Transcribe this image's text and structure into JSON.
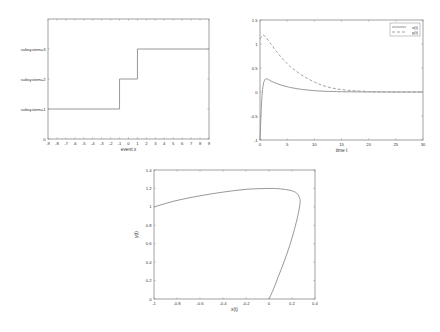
{
  "chart_data": [
    {
      "id": "switching-signal",
      "type": "line",
      "title": "",
      "xlabel": "event x",
      "ylabel": "",
      "xlim": [
        -9,
        9
      ],
      "ylim": [
        0,
        4
      ],
      "grid": false,
      "xticks": [
        -9,
        -8,
        -7,
        -6,
        -5,
        -4,
        -3,
        -2,
        -1,
        0,
        1,
        2,
        3,
        4,
        5,
        6,
        7,
        8,
        9
      ],
      "yticks": [
        {
          "value": 0,
          "label": "0"
        },
        {
          "value": 1,
          "label": "subsystem=1"
        },
        {
          "value": 2,
          "label": "subsystem=2"
        },
        {
          "value": 3,
          "label": "subsystem=3"
        }
      ],
      "series": [
        {
          "name": "switching signal",
          "style": "step",
          "x": [
            -9,
            -1,
            -1,
            1,
            1,
            9
          ],
          "y": [
            1,
            1,
            2,
            2,
            3,
            3
          ]
        }
      ]
    },
    {
      "id": "time-response",
      "type": "line",
      "title": "",
      "xlabel": "time t",
      "ylabel": "",
      "xlim": [
        0,
        30
      ],
      "ylim": [
        -1,
        1.5
      ],
      "grid": false,
      "legend_position": "top-right",
      "xticks": [
        0,
        5,
        10,
        15,
        20,
        25,
        30
      ],
      "yticks": [
        -1,
        -0.5,
        0,
        0.5,
        1,
        1.5
      ],
      "series": [
        {
          "name": "x(t)",
          "style": "solid",
          "x": [
            0,
            0.3,
            0.6,
            1,
            1.5,
            2,
            3,
            4,
            5,
            6,
            8,
            10,
            12,
            15,
            20,
            25,
            30
          ],
          "y": [
            -1,
            -0.2,
            0.15,
            0.27,
            0.26,
            0.23,
            0.18,
            0.14,
            0.11,
            0.085,
            0.05,
            0.028,
            0.015,
            0.006,
            0.001,
            0,
            0
          ]
        },
        {
          "name": "y(t)",
          "style": "dashed",
          "x": [
            0,
            0.5,
            1,
            2,
            3,
            4,
            5,
            6,
            8,
            10,
            12,
            15,
            20,
            25,
            30
          ],
          "y": [
            1.1,
            1.18,
            1.15,
            1.0,
            0.85,
            0.71,
            0.59,
            0.49,
            0.33,
            0.21,
            0.12,
            0.05,
            0.01,
            0,
            0
          ]
        }
      ]
    },
    {
      "id": "phase-portrait",
      "type": "line",
      "title": "",
      "xlabel": "x(t)",
      "ylabel": "y(t)",
      "xlim": [
        -1,
        0.4
      ],
      "ylim": [
        0,
        1.4
      ],
      "grid": false,
      "xticks": [
        -1,
        -0.8,
        -0.6,
        -0.4,
        -0.2,
        0,
        0.2,
        0.4
      ],
      "yticks": [
        0,
        0.2,
        0.4,
        0.6,
        0.8,
        1,
        1.2,
        1.4
      ],
      "series": [
        {
          "name": "trajectory",
          "style": "solid",
          "x": [
            -1,
            -0.8,
            -0.6,
            -0.4,
            -0.2,
            0,
            0.1,
            0.18,
            0.24,
            0.27,
            0.265,
            0.25,
            0.22,
            0.18,
            0.13,
            0.08,
            0.04,
            0
          ],
          "y": [
            1.0,
            1.07,
            1.12,
            1.16,
            1.19,
            1.2,
            1.195,
            1.18,
            1.15,
            1.08,
            1.0,
            0.9,
            0.75,
            0.58,
            0.4,
            0.24,
            0.11,
            0
          ]
        }
      ]
    }
  ],
  "legend": {
    "items": [
      {
        "label": "x(t)",
        "style": "solid"
      },
      {
        "label": "y(t)",
        "style": "dashed"
      }
    ]
  },
  "labels": {
    "chart1_xlabel": "event x",
    "chart2_xlabel": "time t",
    "chart3_xlabel": "x(t)",
    "chart3_ylabel": "y(t)"
  }
}
